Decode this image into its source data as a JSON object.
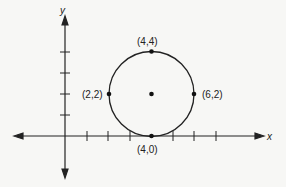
{
  "diagram": {
    "title": "",
    "axes": {
      "x_label": "x",
      "y_label": "y"
    },
    "circle": {
      "center": [
        4,
        2
      ],
      "radius": 2
    },
    "points": [
      {
        "label": "(4,4)",
        "x": 4,
        "y": 4
      },
      {
        "label": "(2,2)",
        "x": 2,
        "y": 2
      },
      {
        "label": "(6,2)",
        "x": 6,
        "y": 2
      },
      {
        "label": "(4,0)",
        "x": 4,
        "y": 0
      },
      {
        "label": "",
        "x": 4,
        "y": 2
      }
    ],
    "x_ticks": [
      1,
      2,
      3,
      4,
      5,
      6,
      7
    ],
    "y_ticks": [
      1,
      2,
      3,
      4
    ],
    "colors": {
      "background": "#f7f7f5",
      "ink": "#222222"
    }
  }
}
